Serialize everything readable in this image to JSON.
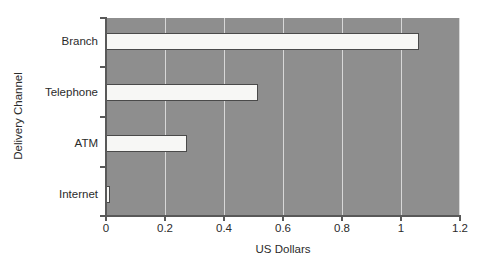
{
  "chart_data": {
    "type": "bar",
    "orientation": "horizontal",
    "title": "",
    "subtitle": "",
    "xlabel": "US Dollars",
    "ylabel": "Delivery Channel",
    "categories": [
      "Internet",
      "ATM",
      "Telephone",
      "Branch"
    ],
    "values": [
      0.015,
      0.275,
      0.515,
      1.06
    ],
    "series": [
      {
        "name": "Cost per transaction",
        "values": [
          0.015,
          0.275,
          0.515,
          1.06
        ]
      }
    ],
    "xlim": [
      0,
      1.2
    ],
    "xticks": [
      0,
      0.2,
      0.4,
      0.6,
      0.8,
      1,
      1.2
    ],
    "xtick_labels": [
      "0",
      "0.2",
      "0.4",
      "0.6",
      "0.8",
      "1",
      "1.2"
    ],
    "ytick_labels": [
      "Internet",
      "ATM",
      "Telephone",
      "Branch"
    ],
    "grid": true,
    "grid_axis": "x",
    "legend": false,
    "legend_position": "none",
    "annotations": [],
    "colors": {
      "plot_background": "#8e8e8e",
      "bar_fill": "#f7f7f5",
      "bar_border": "#4a4a4a",
      "gridline": "#d8d8d8",
      "axis": "#595959",
      "text": "#2b2b2b",
      "figure_background": "#ffffff"
    }
  }
}
